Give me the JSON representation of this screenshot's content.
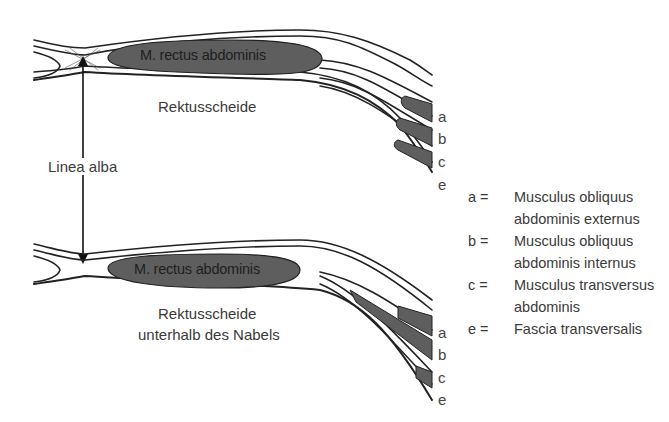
{
  "diagram": {
    "upper": {
      "muscle_label": "M. rectus abdominis",
      "sheath_label": "Rektusscheide",
      "layer_letters": [
        "a",
        "b",
        "c",
        "e"
      ]
    },
    "middle": {
      "linea_alba_label": "Linea alba"
    },
    "lower": {
      "muscle_label": "M. rectus abdominis",
      "sheath_label_line1": "Rektusscheide",
      "sheath_label_line2": "unterhalb des Nabels",
      "layer_letters": [
        "a",
        "b",
        "c",
        "e"
      ]
    },
    "legend": [
      {
        "key": "a =",
        "line1": "Musculus obliquus",
        "line2": "abdominis externus"
      },
      {
        "key": "b =",
        "line1": "Musculus obliquus",
        "line2": "abdominis internus"
      },
      {
        "key": "c =",
        "line1": "Musculus transversus",
        "line2": "abdominis"
      },
      {
        "key": "e =",
        "line1": "Fascia transversalis",
        "line2": ""
      }
    ],
    "colors": {
      "muscle_fill": "#5e5e5e",
      "line": "#222222",
      "background": "#ffffff"
    }
  }
}
